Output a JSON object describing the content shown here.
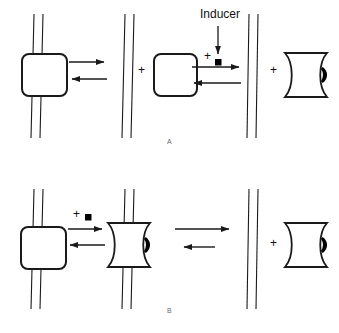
{
  "figure": {
    "width": 339,
    "height": 333,
    "background": "#ffffff",
    "stroke_color": "#1a1a1a",
    "fill_color": "#ffffff",
    "marker_color": "#000000"
  },
  "labels": {
    "inducer": "Inducer",
    "panel_a": "A",
    "panel_b": "B",
    "plus": "+"
  },
  "panel_a": {
    "name": "A",
    "description": "Repressor bound to operator DNA dissociates; free repressor plus inducer forms inducer-repressor complex",
    "species": [
      {
        "id": "repressor-bound-dna",
        "shape": "rounded-square-on-dna",
        "label": "",
        "x": 47,
        "y": 75
      },
      {
        "id": "free-dna",
        "shape": "dna-double-strand",
        "label": "",
        "x": 128,
        "y": 75
      },
      {
        "id": "free-repressor",
        "shape": "rounded-square",
        "label": "",
        "x": 176,
        "y": 75
      },
      {
        "id": "free-dna-right",
        "shape": "dna-double-strand",
        "label": "",
        "x": 253,
        "y": 75
      },
      {
        "id": "inducer-repressor-complex",
        "shape": "bowtie-with-diamond",
        "label": "",
        "x": 305,
        "y": 75
      }
    ],
    "arrows": [
      {
        "id": "a-eq-1-forward",
        "direction": "right",
        "x1": 69,
        "y1": 62,
        "x2": 107,
        "y2": 62
      },
      {
        "id": "a-eq-1-reverse",
        "direction": "left",
        "x1": 69,
        "y1": 79,
        "x2": 107,
        "y2": 79
      },
      {
        "id": "a-eq-2-forward",
        "direction": "right",
        "x1": 192,
        "y1": 65,
        "x2": 241,
        "y2": 65
      },
      {
        "id": "a-eq-2-reverse",
        "direction": "left",
        "x1": 192,
        "y1": 81,
        "x2": 241,
        "y2": 81
      },
      {
        "id": "inducer-arrow",
        "direction": "down",
        "x1": 218,
        "y1": 26,
        "x2": 218,
        "y2": 56
      }
    ],
    "plus_signs": [
      {
        "id": "a-plus-1",
        "x": 140,
        "y": 70
      },
      {
        "id": "a-plus-2",
        "x": 206,
        "y": 56
      },
      {
        "id": "a-plus-3",
        "x": 272,
        "y": 70
      }
    ],
    "inducer_marker": {
      "id": "a-inducer-square",
      "x": 218,
      "y": 62,
      "size": 6
    }
  },
  "panel_b": {
    "name": "B",
    "description": "Inducer binds repressor on DNA forming inducer-repressor complex, which then dissociates from operator DNA",
    "species": [
      {
        "id": "repressor-bound-dna",
        "shape": "rounded-square-on-dna",
        "label": "",
        "x": 47,
        "y": 75
      },
      {
        "id": "complex-bound-dna",
        "shape": "bowtie-with-diamond-on-dna",
        "label": "",
        "x": 128,
        "y": 75
      },
      {
        "id": "free-dna-right",
        "shape": "dna-double-strand",
        "label": "",
        "x": 253,
        "y": 75
      },
      {
        "id": "inducer-repressor-complex",
        "shape": "bowtie-with-diamond",
        "label": "",
        "x": 305,
        "y": 75
      }
    ],
    "arrows": [
      {
        "id": "b-eq-1-forward",
        "direction": "right",
        "x1": 66,
        "y1": 60,
        "x2": 105,
        "y2": 60
      },
      {
        "id": "b-eq-1-reverse",
        "direction": "left",
        "x1": 66,
        "y1": 75,
        "x2": 105,
        "y2": 75
      },
      {
        "id": "b-eq-2-forward",
        "direction": "right",
        "x1": 177,
        "y1": 60,
        "x2": 231,
        "y2": 60
      },
      {
        "id": "b-eq-2-reverse",
        "direction": "left",
        "x1": 186,
        "y1": 78,
        "x2": 215,
        "y2": 78
      }
    ],
    "plus_signs": [
      {
        "id": "b-plus-1",
        "x": 272,
        "y": 70
      }
    ],
    "inducer_marker": {
      "id": "b-inducer-square",
      "x": 89,
      "y": 50,
      "size": 6
    },
    "inducer_plus": {
      "id": "b-plus-inducer",
      "x": 76,
      "y": 47
    }
  }
}
